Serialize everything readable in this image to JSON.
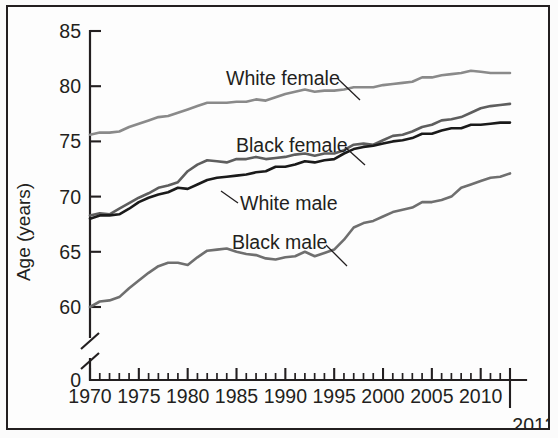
{
  "figure": {
    "background": "#fbfbfb",
    "border_color": "#231f20"
  },
  "chart_data": {
    "type": "line",
    "title": "",
    "xlabel": "",
    "ylabel": "Age (years)",
    "xlim": [
      1970,
      2013
    ],
    "ylim": [
      57.5,
      85
    ],
    "y_axis_break": true,
    "y_break_base_label": "0",
    "grid": false,
    "legend_position": "inline-annotations",
    "y_ticks": [
      60,
      65,
      70,
      75,
      80,
      85
    ],
    "y_tick_labels": [
      "60",
      "65",
      "70",
      "75",
      "80",
      "85"
    ],
    "x_ticks_major": [
      1970,
      1975,
      1980,
      1985,
      1990,
      1995,
      2000,
      2005,
      2010
    ],
    "x_tick_labels": [
      "1970",
      "1975",
      "1980",
      "1985",
      "1990",
      "1995",
      "2000",
      "2005",
      "2010"
    ],
    "x_end_tick": 2013,
    "x_end_label": "2013",
    "x_minor_step": 1,
    "x": [
      1970,
      1971,
      1972,
      1973,
      1974,
      1975,
      1976,
      1977,
      1978,
      1979,
      1980,
      1981,
      1982,
      1983,
      1984,
      1985,
      1986,
      1987,
      1988,
      1989,
      1990,
      1991,
      1992,
      1993,
      1994,
      1995,
      1996,
      1997,
      1998,
      1999,
      2000,
      2001,
      2002,
      2003,
      2004,
      2005,
      2006,
      2007,
      2008,
      2009,
      2010,
      2011,
      2012,
      2013
    ],
    "series": [
      {
        "name": "White female",
        "color": "#8a8a8a",
        "label": "White female",
        "label_x": 218,
        "label_y": 78,
        "leader": [
          [
            330,
            72
          ],
          [
            352,
            93
          ]
        ],
        "values": [
          75.6,
          75.8,
          75.8,
          75.9,
          76.3,
          76.6,
          76.9,
          77.2,
          77.3,
          77.6,
          77.9,
          78.2,
          78.5,
          78.5,
          78.5,
          78.6,
          78.6,
          78.8,
          78.7,
          79.0,
          79.3,
          79.5,
          79.7,
          79.5,
          79.6,
          79.6,
          79.7,
          79.9,
          79.9,
          79.9,
          80.1,
          80.2,
          80.3,
          80.4,
          80.8,
          80.8,
          81.0,
          81.1,
          81.2,
          81.4,
          81.3,
          81.2,
          81.2,
          81.2
        ]
      },
      {
        "name": "Black female",
        "color": "#5e5e5e",
        "label": "Black female",
        "label_x": 228,
        "label_y": 145,
        "leader": [
          [
            337,
            140
          ],
          [
            357,
            158
          ]
        ],
        "values": [
          68.3,
          68.5,
          68.4,
          68.9,
          69.4,
          69.9,
          70.3,
          70.8,
          71.0,
          71.3,
          72.3,
          72.9,
          73.3,
          73.2,
          73.1,
          73.4,
          73.4,
          73.6,
          73.4,
          73.5,
          73.6,
          73.8,
          73.9,
          73.7,
          73.9,
          73.9,
          74.2,
          74.7,
          74.8,
          74.7,
          75.1,
          75.5,
          75.6,
          75.9,
          76.3,
          76.5,
          76.9,
          77.0,
          77.2,
          77.6,
          78.0,
          78.2,
          78.3,
          78.4
        ]
      },
      {
        "name": "White male",
        "color": "#1a1a1a",
        "label": "White male",
        "label_x": 232,
        "label_y": 203,
        "leader": [
          [
            230,
            196
          ],
          [
            213,
            184
          ]
        ],
        "values": [
          68.0,
          68.3,
          68.3,
          68.4,
          68.9,
          69.5,
          69.9,
          70.2,
          70.4,
          70.8,
          70.7,
          71.1,
          71.5,
          71.7,
          71.8,
          71.9,
          72.0,
          72.2,
          72.3,
          72.7,
          72.7,
          72.9,
          73.2,
          73.1,
          73.3,
          73.4,
          73.9,
          74.3,
          74.5,
          74.6,
          74.8,
          75.0,
          75.1,
          75.3,
          75.7,
          75.7,
          76.0,
          76.2,
          76.2,
          76.5,
          76.5,
          76.6,
          76.7,
          76.7
        ]
      },
      {
        "name": "Black male",
        "color": "#6f6f6f",
        "label": "Black male",
        "label_x": 224,
        "label_y": 242,
        "leader": [
          [
            318,
            238
          ],
          [
            339,
            259
          ]
        ],
        "values": [
          60.0,
          60.5,
          60.6,
          60.9,
          61.7,
          62.4,
          63.1,
          63.7,
          64.0,
          64.0,
          63.8,
          64.5,
          65.1,
          65.2,
          65.3,
          65.0,
          64.8,
          64.7,
          64.4,
          64.3,
          64.5,
          64.6,
          65.0,
          64.6,
          64.9,
          65.2,
          66.1,
          67.2,
          67.6,
          67.8,
          68.2,
          68.6,
          68.8,
          69.0,
          69.5,
          69.5,
          69.7,
          70.0,
          70.8,
          71.1,
          71.4,
          71.7,
          71.8,
          72.1
        ]
      }
    ]
  }
}
